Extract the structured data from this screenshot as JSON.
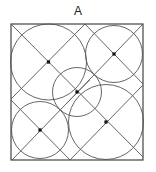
{
  "label": "A",
  "colors": {
    "stroke": "#555555",
    "border": "#444444",
    "dot": "#111111",
    "background": "#ffffff"
  },
  "square": {
    "x": 11,
    "y": 24,
    "width": 132,
    "height": 136
  },
  "lines": [
    {
      "x1": 11,
      "y1": 24,
      "x2": 143,
      "y2": 157
    },
    {
      "x1": 143,
      "y1": 24,
      "x2": 12,
      "y2": 160
    },
    {
      "x1": 85,
      "y1": 24,
      "x2": 11,
      "y2": 99
    },
    {
      "x1": 85,
      "y1": 24,
      "x2": 143,
      "y2": 84
    },
    {
      "x1": 11,
      "y1": 100,
      "x2": 70,
      "y2": 160
    },
    {
      "x1": 70,
      "y1": 160,
      "x2": 143,
      "y2": 85
    },
    {
      "x1": 66,
      "y1": 104,
      "x2": 90,
      "y2": 80
    }
  ],
  "circles": [
    {
      "cx": 48.5,
      "cy": 62,
      "r": 38
    },
    {
      "cx": 114,
      "cy": 54,
      "r": 28.5
    },
    {
      "cx": 77,
      "cy": 92,
      "r": 24.5
    },
    {
      "cx": 40,
      "cy": 130,
      "r": 28.5
    },
    {
      "cx": 106,
      "cy": 122,
      "r": 37.5
    }
  ],
  "dots": [
    {
      "cx": 48.5,
      "cy": 62
    },
    {
      "cx": 114,
      "cy": 54
    },
    {
      "cx": 77,
      "cy": 92
    },
    {
      "cx": 40,
      "cy": 130
    },
    {
      "cx": 106,
      "cy": 122
    }
  ]
}
